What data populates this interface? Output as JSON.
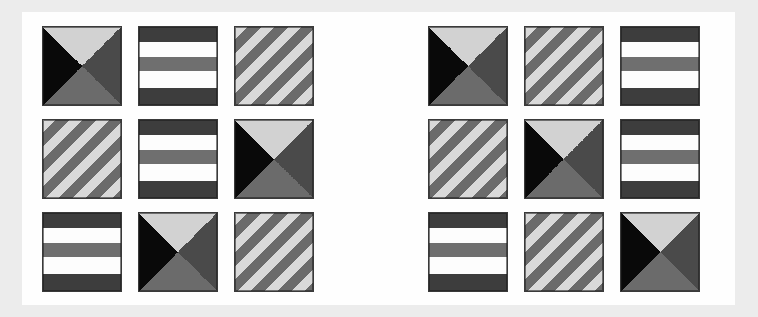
{
  "page": {
    "background_color": "#ececec",
    "card_color": "#fefefe"
  },
  "palette": {
    "black": "#090909",
    "dark_gray": "#3d3d3d",
    "mid_gray": "#6b6b6b",
    "light_gray": "#d2d2d2",
    "white": "#fdfdfd",
    "tile_border": "#3a3a3a"
  },
  "pattern_legend": [
    {
      "key": "x",
      "label": "four-triangle X",
      "description": "square split by both diagonals; top light gray, left black, right dark gray, bottom mid gray"
    },
    {
      "key": "bands",
      "label": "horizontal bands",
      "description": "five horizontal bands: dark, white, mid gray, white, dark"
    },
    {
      "key": "diag",
      "label": "diagonal stripes",
      "description": "repeating light gray and mid gray stripes sloping down to the right"
    }
  ],
  "grids": [
    {
      "name": "left-grid",
      "rows": 3,
      "cols": 3,
      "tiles": [
        {
          "row": 1,
          "col": 1,
          "pattern": "x"
        },
        {
          "row": 1,
          "col": 2,
          "pattern": "bands"
        },
        {
          "row": 1,
          "col": 3,
          "pattern": "diag"
        },
        {
          "row": 2,
          "col": 1,
          "pattern": "diag"
        },
        {
          "row": 2,
          "col": 2,
          "pattern": "bands"
        },
        {
          "row": 2,
          "col": 3,
          "pattern": "x"
        },
        {
          "row": 3,
          "col": 1,
          "pattern": "bands"
        },
        {
          "row": 3,
          "col": 2,
          "pattern": "x"
        },
        {
          "row": 3,
          "col": 3,
          "pattern": "diag"
        }
      ]
    },
    {
      "name": "right-grid",
      "rows": 3,
      "cols": 3,
      "tiles": [
        {
          "row": 1,
          "col": 1,
          "pattern": "x"
        },
        {
          "row": 1,
          "col": 2,
          "pattern": "diag"
        },
        {
          "row": 1,
          "col": 3,
          "pattern": "bands"
        },
        {
          "row": 2,
          "col": 1,
          "pattern": "diag"
        },
        {
          "row": 2,
          "col": 2,
          "pattern": "x"
        },
        {
          "row": 2,
          "col": 3,
          "pattern": "bands"
        },
        {
          "row": 3,
          "col": 1,
          "pattern": "bands"
        },
        {
          "row": 3,
          "col": 2,
          "pattern": "diag"
        },
        {
          "row": 3,
          "col": 3,
          "pattern": "x"
        }
      ]
    }
  ]
}
